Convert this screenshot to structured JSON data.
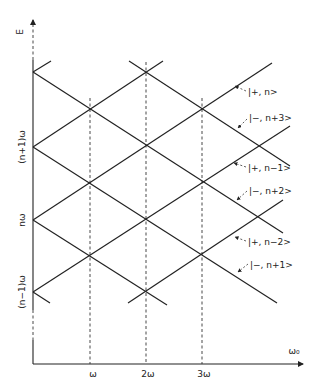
{
  "diagram": {
    "y_axis_label": "E",
    "x_axis_label": "ω₀",
    "y_ticks": [
      {
        "label": "(n+1)ω",
        "y": 147
      },
      {
        "label": "nω",
        "y": 220
      },
      {
        "label": "(n−1)ω",
        "y": 292
      }
    ],
    "x_ticks": [
      {
        "label": "ω",
        "x": 90
      },
      {
        "label": "2ω",
        "x": 146
      },
      {
        "label": "3ω",
        "x": 202
      }
    ],
    "state_labels": [
      {
        "text": "|+, n>",
        "x": 246,
        "y": 95
      },
      {
        "text": "|−, n+3>",
        "x": 247,
        "y": 121
      },
      {
        "text": "|+, n−1>",
        "x": 247,
        "y": 171
      },
      {
        "text": "|−, n+2>",
        "x": 247,
        "y": 193
      },
      {
        "text": "|+, n−2>",
        "x": 247,
        "y": 245
      },
      {
        "text": "|−, n+1>",
        "x": 249,
        "y": 267
      }
    ],
    "colors": {
      "line": "#222222",
      "background": "#ffffff"
    }
  }
}
